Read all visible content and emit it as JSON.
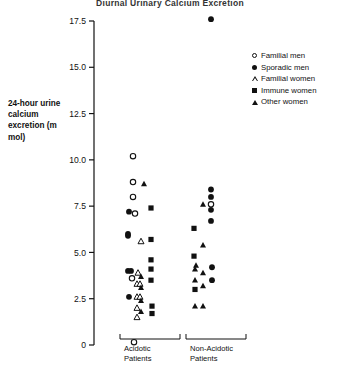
{
  "chart_data": {
    "type": "scatter",
    "title": "Diurnal Urinary Calcium Excretion",
    "xlabel": "",
    "ylabel": "24-hour urine calcium excretion (m mol)",
    "ylim": [
      0,
      17.5
    ],
    "yticks": [
      "0",
      "2.5",
      "5.0",
      "7.5",
      "10.0",
      "12.5",
      "15.0",
      "17.5"
    ],
    "ytick_values": [
      0,
      2.5,
      5.0,
      7.5,
      10.0,
      12.5,
      15.0,
      17.5
    ],
    "grid": false,
    "legend_position": "upper right",
    "groups": [
      {
        "name": "Acidotic Patients",
        "label_line1": "Acidotic",
        "label_line2": "Patients"
      },
      {
        "name": "Non-Acidotic Patients",
        "label_line1": "Non-Acidotic",
        "label_line2": "Patients"
      }
    ],
    "series": [
      {
        "name": "Familial men",
        "marker": "open-circle",
        "points": [
          {
            "group": "Acidotic Patients",
            "jitter": 0,
            "value": 10.2
          },
          {
            "group": "Acidotic Patients",
            "jitter": 0,
            "value": 8.8
          },
          {
            "group": "Acidotic Patients",
            "jitter": 0,
            "value": 8.0
          },
          {
            "group": "Acidotic Patients",
            "jitter": 2,
            "value": 7.1
          },
          {
            "group": "Acidotic Patients",
            "jitter": -1,
            "value": 3.6
          },
          {
            "group": "Acidotic Patients",
            "jitter": 1,
            "value": 0.15
          },
          {
            "group": "Non-Acidotic Patients",
            "jitter": 3,
            "value": 7.6
          }
        ]
      },
      {
        "name": "Sporadic men",
        "marker": "filled-circle",
        "points": [
          {
            "group": "Acidotic Patients",
            "jitter": -4,
            "value": 7.2
          },
          {
            "group": "Acidotic Patients",
            "jitter": -5,
            "value": 6.0
          },
          {
            "group": "Acidotic Patients",
            "jitter": -5,
            "value": 5.9
          },
          {
            "group": "Acidotic Patients",
            "jitter": -5,
            "value": 4.0
          },
          {
            "group": "Acidotic Patients",
            "jitter": -2,
            "value": 4.0
          },
          {
            "group": "Acidotic Patients",
            "jitter": -4,
            "value": 2.6
          },
          {
            "group": "Non-Acidotic Patients",
            "jitter": 3,
            "value": 17.6
          },
          {
            "group": "Non-Acidotic Patients",
            "jitter": 3,
            "value": 8.4
          },
          {
            "group": "Non-Acidotic Patients",
            "jitter": 3,
            "value": 8.0
          },
          {
            "group": "Non-Acidotic Patients",
            "jitter": 3,
            "value": 7.3
          },
          {
            "group": "Non-Acidotic Patients",
            "jitter": 3,
            "value": 6.7
          },
          {
            "group": "Non-Acidotic Patients",
            "jitter": 4,
            "value": 4.2
          },
          {
            "group": "Non-Acidotic Patients",
            "jitter": 4,
            "value": 3.5
          }
        ]
      },
      {
        "name": "Familial women",
        "marker": "open-triangle",
        "points": [
          {
            "group": "Acidotic Patients",
            "jitter": 8,
            "value": 5.6
          },
          {
            "group": "Acidotic Patients",
            "jitter": 5,
            "value": 3.9
          },
          {
            "group": "Acidotic Patients",
            "jitter": 4,
            "value": 3.3
          },
          {
            "group": "Acidotic Patients",
            "jitter": 7,
            "value": 3.3
          },
          {
            "group": "Acidotic Patients",
            "jitter": 4,
            "value": 2.6
          },
          {
            "group": "Acidotic Patients",
            "jitter": 7,
            "value": 2.6
          },
          {
            "group": "Acidotic Patients",
            "jitter": 4,
            "value": 2.0
          },
          {
            "group": "Acidotic Patients",
            "jitter": 4,
            "value": 1.5
          }
        ]
      },
      {
        "name": "Immune women",
        "marker": "filled-square",
        "points": [
          {
            "group": "Acidotic Patients",
            "jitter": 18,
            "value": 7.4
          },
          {
            "group": "Acidotic Patients",
            "jitter": 18,
            "value": 5.7
          },
          {
            "group": "Acidotic Patients",
            "jitter": 18,
            "value": 4.6
          },
          {
            "group": "Acidotic Patients",
            "jitter": 18,
            "value": 4.1
          },
          {
            "group": "Acidotic Patients",
            "jitter": 18,
            "value": 3.5
          },
          {
            "group": "Acidotic Patients",
            "jitter": 19,
            "value": 2.1
          },
          {
            "group": "Acidotic Patients",
            "jitter": 19,
            "value": 1.7
          },
          {
            "group": "Non-Acidotic Patients",
            "jitter": -14,
            "value": 6.3
          },
          {
            "group": "Non-Acidotic Patients",
            "jitter": -14,
            "value": 4.8
          },
          {
            "group": "Non-Acidotic Patients",
            "jitter": -13,
            "value": 3.0
          }
        ]
      },
      {
        "name": "Other women",
        "marker": "filled-triangle",
        "points": [
          {
            "group": "Acidotic Patients",
            "jitter": 11,
            "value": 8.7
          },
          {
            "group": "Acidotic Patients",
            "jitter": 8,
            "value": 3.7
          },
          {
            "group": "Acidotic Patients",
            "jitter": 8,
            "value": 3.1
          },
          {
            "group": "Acidotic Patients",
            "jitter": 8,
            "value": 2.4
          },
          {
            "group": "Acidotic Patients",
            "jitter": 8,
            "value": 1.8
          },
          {
            "group": "Non-Acidotic Patients",
            "jitter": -5,
            "value": 7.6
          },
          {
            "group": "Non-Acidotic Patients",
            "jitter": -5,
            "value": 5.4
          },
          {
            "group": "Non-Acidotic Patients",
            "jitter": -12,
            "value": 4.3
          },
          {
            "group": "Non-Acidotic Patients",
            "jitter": -13,
            "value": 4.1
          },
          {
            "group": "Non-Acidotic Patients",
            "jitter": -5,
            "value": 3.9
          },
          {
            "group": "Non-Acidotic Patients",
            "jitter": -13,
            "value": 3.5
          },
          {
            "group": "Non-Acidotic Patients",
            "jitter": -5,
            "value": 3.2
          },
          {
            "group": "Non-Acidotic Patients",
            "jitter": -13,
            "value": 2.1
          },
          {
            "group": "Non-Acidotic Patients",
            "jitter": -5,
            "value": 2.1
          }
        ]
      }
    ]
  },
  "legend": {
    "items": [
      {
        "label": "Familial men",
        "marker": "open-circle"
      },
      {
        "label": "Sporadic men",
        "marker": "filled-circle"
      },
      {
        "label": "Familial women",
        "marker": "open-triangle"
      },
      {
        "label": "Immune women",
        "marker": "filled-square"
      },
      {
        "label": "Other women",
        "marker": "filled-triangle"
      }
    ]
  }
}
